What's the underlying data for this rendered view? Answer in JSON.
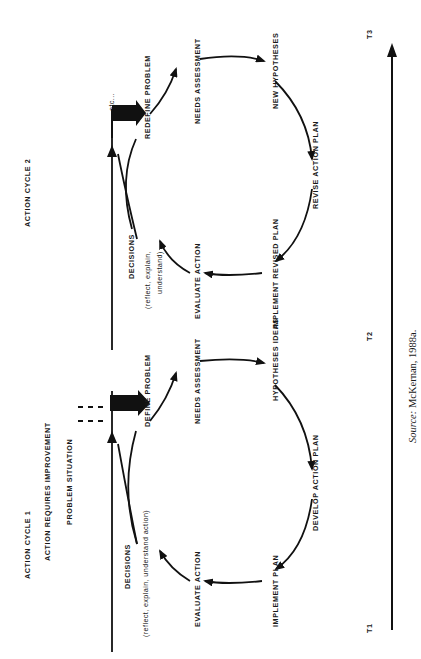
{
  "figure": {
    "orientation": "rotated-90-ccw",
    "cycles": [
      {
        "title": "ACTION CYCLE 1",
        "subtitle": "ACTION REQUIRES IMPROVEMENT",
        "trigger": "PROBLEM SITUATION",
        "nodes": {
          "define": "DEFINE PROBLEM",
          "needs": "NEEDS ASSESSMENT",
          "hypotheses": "HYPOTHESES IDEAS",
          "develop": "DEVELOP ACTION PLAN",
          "implement": "IMPLEMENT PLAN",
          "evaluate": "EVALUATE ACTION",
          "decisions": "DECISIONS",
          "decisions_note": "(reflect, explain, understand action)"
        }
      },
      {
        "title": "ACTION CYCLE 2",
        "nodes": {
          "define": "REDEFINE PROBLEM",
          "needs": "NEEDS ASSESSMENT",
          "hypotheses": "NEW HYPOTHESES",
          "develop": "REVISE ACTION PLAN",
          "implement": "IMPLEMENT REVISED PLAN",
          "evaluate": "EVALUATE ACTION",
          "decisions": "DECISIONS",
          "decisions_note_1": "(reflect, explain,",
          "decisions_note_2": "understand)"
        }
      }
    ],
    "continuation": "etc...",
    "timeline": {
      "labels": [
        "T1",
        "T2",
        "T3"
      ]
    },
    "source": {
      "prefix": "Source:",
      "text": " McKernan, 1988a."
    }
  }
}
